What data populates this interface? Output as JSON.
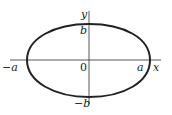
{
  "diagram": {
    "type": "ellipse-on-axes",
    "colors": {
      "curve": "#222222",
      "axes": "#444444",
      "background": "#ffffff"
    },
    "axes": {
      "x_label": "x",
      "y_label": "y",
      "origin_label": "0"
    },
    "ellipse": {
      "x_intercepts": [
        "−a",
        "a"
      ],
      "y_intercepts": [
        "b",
        "−b"
      ]
    },
    "labels": {
      "neg_a": "−a",
      "pos_a": "a",
      "pos_b": "b",
      "neg_b": "−b",
      "x": "x",
      "y": "y",
      "origin": "0"
    }
  }
}
